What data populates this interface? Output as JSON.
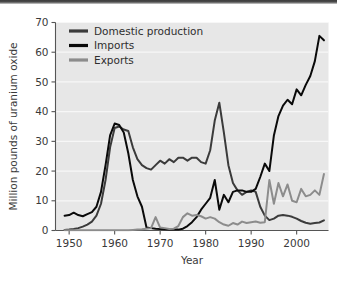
{
  "figure": {
    "background_color": "#ffffff",
    "plot_background_color": "#e7e7e7",
    "gridline_color": "#f7f7f7",
    "axis_color": "#555555",
    "top_border_color": "#3c3c3c"
  },
  "legend": {
    "position": "top-left-inside",
    "entries": [
      {
        "label": "Domestic production",
        "color": "#3b3b3b",
        "name": "legend-item-domestic-production"
      },
      {
        "label": "Imports",
        "color": "#0a0a0a",
        "name": "legend-item-imports"
      },
      {
        "label": "Exports",
        "color": "#8c8c8c",
        "name": "legend-item-exports"
      }
    ]
  },
  "axes": {
    "x": {
      "label": "Year",
      "ticks": [
        1950,
        1960,
        1970,
        1980,
        1990,
        2000
      ],
      "tick_labels": [
        "1950",
        "1960",
        "1970",
        "1980",
        "1990",
        "2000"
      ],
      "min": 1947,
      "max": 2007
    },
    "y": {
      "label": "Million pounds of uranium oxide",
      "ticks": [
        0,
        10,
        20,
        30,
        40,
        50,
        60,
        70
      ],
      "tick_labels": [
        "0",
        "10",
        "20",
        "30",
        "40",
        "50",
        "60",
        "70"
      ],
      "min": 0,
      "max": 70
    }
  },
  "chart_data": {
    "type": "line",
    "title": "",
    "xlabel": "Year",
    "ylabel": "Million pounds of uranium oxide",
    "xlim": [
      1947,
      2007
    ],
    "ylim": [
      0,
      70
    ],
    "grid": true,
    "legend_position": "top-left-inside",
    "x": [
      1949,
      1950,
      1951,
      1952,
      1953,
      1954,
      1955,
      1956,
      1957,
      1958,
      1959,
      1960,
      1961,
      1962,
      1963,
      1964,
      1965,
      1966,
      1967,
      1968,
      1969,
      1970,
      1971,
      1972,
      1973,
      1974,
      1975,
      1976,
      1977,
      1978,
      1979,
      1980,
      1981,
      1982,
      1983,
      1984,
      1985,
      1986,
      1987,
      1988,
      1989,
      1990,
      1991,
      1992,
      1993,
      1994,
      1995,
      1996,
      1997,
      1998,
      1999,
      2000,
      2001,
      2002,
      2003,
      2004,
      2005,
      2006
    ],
    "series": [
      {
        "name": "Domestic production",
        "color": "#3b3b3b",
        "values": [
          0.2,
          0.3,
          0.5,
          0.8,
          1.3,
          2.0,
          3.0,
          5.0,
          9.0,
          17.0,
          28.0,
          34.5,
          35.0,
          34.0,
          33.5,
          28.0,
          24.0,
          22.0,
          21.0,
          20.5,
          22.0,
          23.5,
          22.5,
          24.0,
          23.0,
          24.5,
          24.5,
          23.5,
          24.5,
          24.5,
          23.0,
          22.5,
          27.0,
          37.0,
          43.0,
          33.0,
          22.0,
          16.0,
          13.5,
          12.0,
          13.0,
          13.5,
          13.0,
          8.0,
          5.0,
          3.5,
          4.0,
          5.0,
          5.2,
          5.0,
          4.6,
          4.0,
          3.2,
          2.6,
          2.3,
          2.5,
          2.7,
          3.4
        ]
      },
      {
        "name": "Imports",
        "color": "#0a0a0a",
        "values": [
          5.0,
          5.2,
          6.0,
          5.2,
          4.8,
          5.5,
          6.2,
          8.0,
          13.0,
          22.0,
          32.0,
          36.0,
          35.5,
          33.0,
          26.0,
          17.0,
          11.5,
          8.0,
          1.0,
          0.8,
          0.6,
          0.5,
          0.4,
          0.3,
          0.3,
          0.3,
          0.6,
          1.5,
          2.8,
          4.5,
          7.0,
          9.0,
          11.0,
          17.0,
          7.0,
          12.0,
          9.5,
          13.0,
          13.5,
          13.5,
          13.0,
          13.0,
          14.0,
          18.0,
          22.5,
          20.0,
          32.0,
          38.5,
          42.0,
          44.0,
          42.5,
          47.5,
          45.5,
          49.0,
          52.0,
          57.0,
          65.5,
          64.0
        ]
      },
      {
        "name": "Exports",
        "color": "#8c8c8c",
        "values": [
          0.1,
          0.1,
          0.1,
          0.1,
          0.1,
          0.1,
          0.1,
          0.1,
          0.1,
          0.1,
          0.1,
          0.1,
          0.1,
          0.1,
          0.1,
          0.2,
          0.3,
          0.4,
          0.6,
          0.8,
          4.5,
          1.0,
          0.8,
          0.5,
          0.6,
          1.5,
          4.5,
          5.8,
          5.0,
          5.2,
          4.8,
          4.0,
          4.5,
          4.0,
          2.8,
          2.0,
          1.6,
          2.5,
          2.0,
          3.0,
          2.5,
          2.8,
          3.0,
          2.6,
          2.8,
          17.0,
          9.0,
          16.0,
          11.5,
          15.5,
          10.0,
          9.5,
          14.0,
          11.5,
          12.0,
          13.5,
          12.0,
          19.0
        ]
      }
    ]
  }
}
